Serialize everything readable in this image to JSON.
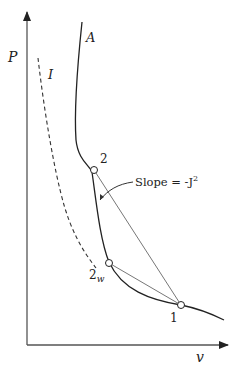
{
  "diagram": {
    "axes": {
      "y_label": "P",
      "x_label": "v"
    },
    "curves": {
      "solid_curve_label": "A",
      "dashed_curve_label": "I"
    },
    "points": [
      {
        "id": "2",
        "label": "2"
      },
      {
        "id": "2w",
        "label": "2",
        "subscript": "w"
      },
      {
        "id": "1",
        "label": "1"
      }
    ],
    "annotation": {
      "text": "Slope = -J",
      "superscript": "2"
    },
    "colors": {
      "line": "#222222",
      "chord": "#777777",
      "background": "#ffffff"
    }
  }
}
